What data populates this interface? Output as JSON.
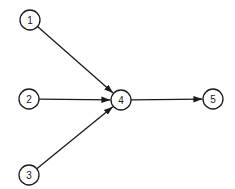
{
  "diagram": {
    "type": "directed-graph",
    "colors": {
      "stroke": "#1a1a1a",
      "background": "#ffffff"
    },
    "node_radius": 10,
    "nodes": [
      {
        "id": "1",
        "label": "1",
        "x": 30,
        "y": 20
      },
      {
        "id": "2",
        "label": "2",
        "x": 29,
        "y": 99
      },
      {
        "id": "3",
        "label": "3",
        "x": 29,
        "y": 175
      },
      {
        "id": "4",
        "label": "4",
        "x": 121,
        "y": 100
      },
      {
        "id": "5",
        "label": "5",
        "x": 213,
        "y": 99
      }
    ],
    "edges": [
      {
        "from": "1",
        "to": "4"
      },
      {
        "from": "2",
        "to": "4"
      },
      {
        "from": "3",
        "to": "4"
      },
      {
        "from": "4",
        "to": "5"
      }
    ]
  }
}
